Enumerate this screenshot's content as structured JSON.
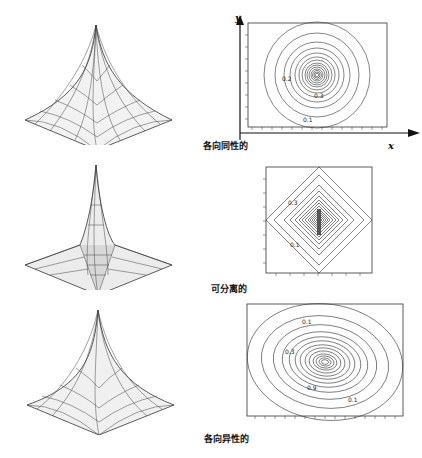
{
  "figure": {
    "rows": [
      {
        "id": "isotropic",
        "caption": "各向同性的",
        "surface_shape": "cusp",
        "contour_shape": "circle",
        "contour_labels": [
          "0.2",
          "0.1",
          "0.3",
          "0.5",
          "0.7"
        ]
      },
      {
        "id": "separable",
        "caption": "可分离的",
        "surface_shape": "cusp-separable",
        "contour_shape": "diamond",
        "contour_labels": [
          "0.3",
          "0.1"
        ]
      },
      {
        "id": "anisotropic",
        "caption": "各向异性的",
        "surface_shape": "cusp",
        "contour_shape": "ellipse",
        "contour_labels": [
          "0.1",
          "0.3",
          "0.9",
          "0.1"
        ]
      }
    ],
    "axes": {
      "x_label": "x",
      "y_label": "y"
    }
  },
  "colors": {
    "ink": "#1a1a1a",
    "contour": "#333333",
    "mesh": "#444444",
    "ghost": "#e6e6e6"
  }
}
